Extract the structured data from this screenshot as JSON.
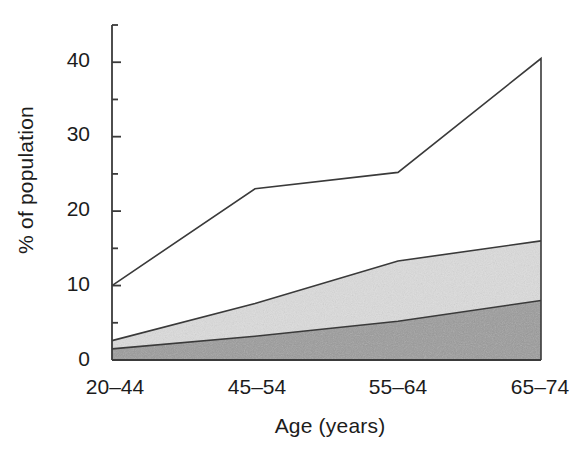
{
  "chart_data": {
    "type": "area",
    "title": "",
    "subtitle": "",
    "xlabel": "Age (years)",
    "ylabel": "% of population",
    "categories": [
      "20–44",
      "45–54",
      "55–64",
      "65–74"
    ],
    "ytick_labels": [
      "0",
      "10",
      "20",
      "30",
      "40"
    ],
    "ytick_values": [
      0,
      10,
      20,
      30,
      40
    ],
    "yminor_values": [
      5,
      15,
      25,
      35,
      45
    ],
    "ylim": [
      0,
      45
    ],
    "grid": false,
    "legend": "none",
    "stacked": true,
    "series": [
      {
        "name": "lower band",
        "style": "filled-dark-gray",
        "color": "#9b9b9b",
        "values": [
          1.5,
          3.2,
          5.2,
          8.0
        ]
      },
      {
        "name": "middle band (cumulative)",
        "style": "filled-light-gray",
        "color": "#dcdcdc",
        "values": [
          2.6,
          7.6,
          13.3,
          16.0
        ]
      },
      {
        "name": "upper boundary (cumulative)",
        "style": "line-only-unfilled",
        "color": "#ffffff",
        "values": [
          10.0,
          23.0,
          25.2,
          40.5
        ]
      }
    ],
    "line_color": "#3a3a3a",
    "axis_color": "#3a3a3a"
  },
  "axes": {
    "y_axis_name": "y-axis",
    "x_axis_name": "x-axis"
  }
}
